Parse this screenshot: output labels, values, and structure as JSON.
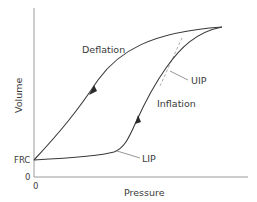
{
  "figure": {
    "colors": {
      "curve": "#3a3a3a",
      "axis": "#9a9a9a",
      "tangent": "#9a9a9a",
      "text": "#3a3a3a",
      "background": "#ffffff"
    },
    "axes": {
      "x_label": "Pressure",
      "y_label": "Volume",
      "x_origin_tick": "0",
      "y_origin_tick": "0",
      "y_frc_tick": "FRC"
    },
    "curves": {
      "deflation_label": "Deflation",
      "inflation_label": "Inflation"
    },
    "annotations": {
      "lip_label": "LIP",
      "uip_label": "UIP"
    }
  }
}
